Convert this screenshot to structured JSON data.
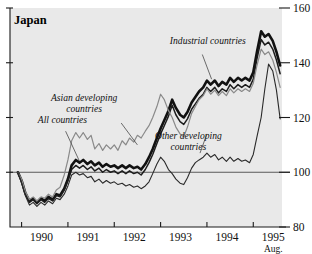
{
  "chart_data": {
    "type": "line",
    "title": "Japan",
    "xlabel": "",
    "ylabel": "",
    "ylim": [
      80,
      160
    ],
    "xlim": [
      1989.75,
      1995.62
    ],
    "grid": false,
    "legend_position": "inline-annotations",
    "y_ticks": [
      80,
      100,
      120,
      140,
      160
    ],
    "y_tick_labels": [
      "80",
      "100",
      "120",
      "140",
      "160"
    ],
    "y_axis_side": "right",
    "reference_line": 100,
    "x_ticks": [
      1990,
      1991,
      1992,
      1993,
      1994,
      1995
    ],
    "x_tick_labels": [
      "1990",
      "1991",
      "1992",
      "1993",
      "1994",
      "1995"
    ],
    "x_end_note": "Aug.",
    "annotations": [
      {
        "text": "All countries",
        "x": 1990.35,
        "y": 118
      },
      {
        "text": "Asian developing countries",
        "x": 1991.35,
        "y": 126
      },
      {
        "text": "Industrial countries",
        "x": 1993.2,
        "y": 147
      },
      {
        "text": "Other developing countries",
        "x": 1993.6,
        "y": 112
      }
    ],
    "series": [
      {
        "name": "All countries",
        "style": "thick-black",
        "color": "#111111",
        "width": 2.6,
        "x": [
          1989.92,
          1990.0,
          1990.08,
          1990.17,
          1990.25,
          1990.33,
          1990.42,
          1990.5,
          1990.58,
          1990.67,
          1990.75,
          1990.83,
          1990.92,
          1991.0,
          1991.08,
          1991.17,
          1991.25,
          1991.33,
          1991.42,
          1991.5,
          1991.58,
          1991.67,
          1991.75,
          1991.83,
          1991.92,
          1992.0,
          1992.08,
          1992.17,
          1992.25,
          1992.33,
          1992.42,
          1992.5,
          1992.58,
          1992.67,
          1992.75,
          1992.83,
          1992.92,
          1993.0,
          1993.08,
          1993.17,
          1993.25,
          1993.33,
          1993.42,
          1993.5,
          1993.58,
          1993.67,
          1993.75,
          1993.83,
          1993.92,
          1994.0,
          1994.08,
          1994.17,
          1994.25,
          1994.33,
          1994.42,
          1994.5,
          1994.58,
          1994.67,
          1994.75,
          1994.83,
          1994.92,
          1995.0,
          1995.08,
          1995.17,
          1995.25,
          1995.33,
          1995.42,
          1995.5,
          1995.58
        ],
        "values": [
          100.0,
          97.0,
          92.5,
          89.5,
          90.5,
          89.0,
          90.5,
          89.5,
          91.0,
          90.0,
          92.0,
          91.5,
          94.0,
          97.5,
          102.5,
          104.5,
          103.5,
          104.5,
          103.0,
          104.0,
          102.5,
          103.5,
          102.0,
          103.0,
          102.0,
          102.5,
          101.5,
          102.5,
          101.5,
          102.5,
          101.5,
          102.0,
          101.0,
          103.0,
          105.5,
          108.5,
          112.5,
          116.0,
          119.0,
          122.5,
          126.5,
          123.5,
          121.0,
          120.0,
          122.0,
          125.5,
          127.5,
          129.5,
          131.0,
          133.5,
          132.0,
          133.5,
          131.5,
          133.0,
          132.0,
          134.5,
          133.0,
          134.5,
          133.5,
          134.5,
          133.5,
          136.5,
          144.0,
          151.5,
          149.5,
          150.5,
          148.0,
          144.0,
          139.0
        ]
      },
      {
        "name": "Industrial countries",
        "style": "medium-black",
        "color": "#1c1c1c",
        "width": 1.5,
        "x": [
          1989.92,
          1990.0,
          1990.08,
          1990.17,
          1990.25,
          1990.33,
          1990.42,
          1990.5,
          1990.58,
          1990.67,
          1990.75,
          1990.83,
          1990.92,
          1991.0,
          1991.08,
          1991.17,
          1991.25,
          1991.33,
          1991.42,
          1991.5,
          1991.58,
          1991.67,
          1991.75,
          1991.83,
          1991.92,
          1992.0,
          1992.08,
          1992.17,
          1992.25,
          1992.33,
          1992.42,
          1992.5,
          1992.58,
          1992.67,
          1992.75,
          1992.83,
          1992.92,
          1993.0,
          1993.08,
          1993.17,
          1993.25,
          1993.33,
          1993.42,
          1993.5,
          1993.58,
          1993.67,
          1993.75,
          1993.83,
          1993.92,
          1994.0,
          1994.08,
          1994.17,
          1994.25,
          1994.33,
          1994.42,
          1994.5,
          1994.58,
          1994.67,
          1994.75,
          1994.83,
          1994.92,
          1995.0,
          1995.08,
          1995.17,
          1995.25,
          1995.33,
          1995.42,
          1995.5,
          1995.58
        ],
        "values": [
          100.0,
          96.5,
          92.0,
          89.0,
          90.0,
          88.5,
          90.0,
          89.0,
          90.5,
          89.5,
          91.5,
          91.0,
          93.5,
          97.0,
          101.0,
          102.5,
          101.5,
          102.5,
          101.0,
          102.0,
          100.5,
          101.5,
          100.0,
          101.0,
          100.0,
          100.5,
          99.5,
          100.5,
          99.5,
          100.5,
          99.5,
          100.0,
          99.0,
          101.0,
          103.5,
          106.5,
          110.5,
          114.0,
          117.0,
          120.5,
          124.5,
          121.0,
          118.5,
          117.5,
          119.5,
          123.0,
          125.0,
          127.0,
          128.5,
          131.0,
          129.5,
          131.0,
          129.0,
          130.5,
          129.5,
          132.0,
          130.5,
          132.0,
          131.0,
          132.0,
          131.0,
          134.0,
          141.5,
          148.5,
          146.5,
          147.5,
          145.0,
          141.0,
          136.0
        ]
      },
      {
        "name": "Asian developing countries",
        "style": "thin-gray",
        "color": "#8a8a8a",
        "width": 1.2,
        "x": [
          1989.92,
          1990.0,
          1990.08,
          1990.17,
          1990.25,
          1990.33,
          1990.42,
          1990.5,
          1990.58,
          1990.67,
          1990.75,
          1990.83,
          1990.92,
          1991.0,
          1991.08,
          1991.17,
          1991.25,
          1991.33,
          1991.42,
          1991.5,
          1991.58,
          1991.67,
          1991.75,
          1991.83,
          1991.92,
          1992.0,
          1992.08,
          1992.17,
          1992.25,
          1992.33,
          1992.42,
          1992.5,
          1992.58,
          1992.67,
          1992.75,
          1992.83,
          1992.92,
          1993.0,
          1993.08,
          1993.17,
          1993.25,
          1993.33,
          1993.42,
          1993.5,
          1993.58,
          1993.67,
          1993.75,
          1993.83,
          1993.92,
          1994.0,
          1994.08,
          1994.17,
          1994.25,
          1994.33,
          1994.42,
          1994.5,
          1994.58,
          1994.67,
          1994.75,
          1994.83,
          1994.92,
          1995.0,
          1995.08,
          1995.17,
          1995.25,
          1995.33,
          1995.42,
          1995.5,
          1995.58
        ],
        "values": [
          100.0,
          97.5,
          93.0,
          90.0,
          91.0,
          89.5,
          91.0,
          90.5,
          92.0,
          91.0,
          93.5,
          94.5,
          99.0,
          104.5,
          111.5,
          114.5,
          112.5,
          114.5,
          112.0,
          113.5,
          108.5,
          110.5,
          108.0,
          110.0,
          108.5,
          110.0,
          108.0,
          111.5,
          110.0,
          112.5,
          111.0,
          113.5,
          112.5,
          115.0,
          117.0,
          120.0,
          124.0,
          128.5,
          126.5,
          122.5,
          120.0,
          116.5,
          114.0,
          113.0,
          116.5,
          121.5,
          124.0,
          126.5,
          128.0,
          130.5,
          128.5,
          130.0,
          128.0,
          129.5,
          128.0,
          130.5,
          129.0,
          130.5,
          129.5,
          130.5,
          129.5,
          132.5,
          139.0,
          145.0,
          143.0,
          144.0,
          141.0,
          136.5,
          131.0
        ]
      },
      {
        "name": "Other developing countries",
        "style": "thin-black",
        "color": "#2a2a2a",
        "width": 1.1,
        "x": [
          1989.92,
          1990.0,
          1990.08,
          1990.17,
          1990.25,
          1990.33,
          1990.42,
          1990.5,
          1990.58,
          1990.67,
          1990.75,
          1990.83,
          1990.92,
          1991.0,
          1991.08,
          1991.17,
          1991.25,
          1991.33,
          1991.42,
          1991.5,
          1991.58,
          1991.67,
          1991.75,
          1991.83,
          1991.92,
          1992.0,
          1992.08,
          1992.17,
          1992.25,
          1992.33,
          1992.42,
          1992.5,
          1992.58,
          1992.67,
          1992.75,
          1992.83,
          1992.92,
          1993.0,
          1993.08,
          1993.17,
          1993.25,
          1993.33,
          1993.42,
          1993.5,
          1993.58,
          1993.67,
          1993.75,
          1993.83,
          1993.92,
          1994.0,
          1994.08,
          1994.17,
          1994.25,
          1994.33,
          1994.42,
          1994.5,
          1994.58,
          1994.67,
          1994.75,
          1994.83,
          1994.92,
          1995.0,
          1995.08,
          1995.17,
          1995.25,
          1995.33,
          1995.42,
          1995.5,
          1995.58
        ],
        "values": [
          100.0,
          96.0,
          91.5,
          88.0,
          89.0,
          87.5,
          89.0,
          88.0,
          89.5,
          88.5,
          90.5,
          90.0,
          92.0,
          95.0,
          99.0,
          100.0,
          99.0,
          99.5,
          98.0,
          98.5,
          96.5,
          97.5,
          96.0,
          97.0,
          96.0,
          96.5,
          95.5,
          96.0,
          95.0,
          95.5,
          94.5,
          95.0,
          94.0,
          95.0,
          96.5,
          99.5,
          103.0,
          105.5,
          104.0,
          101.0,
          99.5,
          97.5,
          96.0,
          95.5,
          98.0,
          101.5,
          103.5,
          104.5,
          105.5,
          107.0,
          105.5,
          106.5,
          104.5,
          105.5,
          104.0,
          105.5,
          104.0,
          105.0,
          104.0,
          104.5,
          103.5,
          106.5,
          113.0,
          120.0,
          130.5,
          139.5,
          137.0,
          130.0,
          119.5
        ]
      }
    ]
  }
}
